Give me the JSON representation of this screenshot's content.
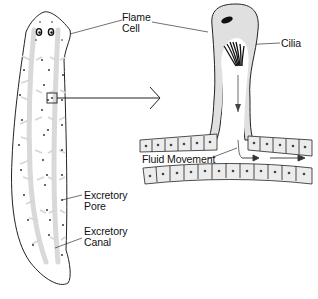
{
  "diagram": {
    "labels": {
      "flame_cell": [
        "Flame",
        "Cell"
      ],
      "cilia": "Cilia",
      "fluid_movement": "Fluid Movement",
      "excretory_pore": [
        "Excretory",
        "Pore"
      ],
      "excretory_canal": [
        "Excretory",
        "Canal"
      ]
    },
    "colors": {
      "outline": "#222222",
      "canal_fill": "#d9d9d9",
      "cell_fill": "#e4e4e4",
      "background": "#ffffff"
    }
  }
}
